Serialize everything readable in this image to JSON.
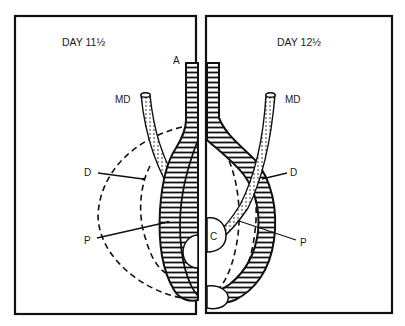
{
  "figure": {
    "panels": [
      {
        "id": "left",
        "title": "DAY 11½",
        "labels": {
          "A": "A",
          "MD": "MD",
          "D": "D",
          "P": "P"
        }
      },
      {
        "id": "right",
        "title": "DAY 12½",
        "labels": {
          "MD": "MD",
          "D": "D",
          "P": "P",
          "C": "C"
        }
      }
    ],
    "colors": {
      "ink": "#111111",
      "background": "#ffffff"
    }
  }
}
